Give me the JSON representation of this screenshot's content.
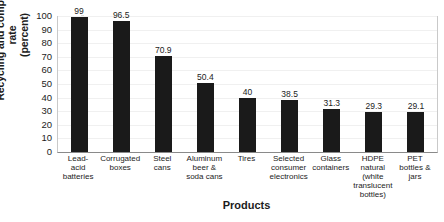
{
  "chart_data": {
    "type": "bar",
    "title": "",
    "xlabel": "Products",
    "ylabel": "Recycling and composting rate\n(percent)",
    "ylim": [
      0,
      100
    ],
    "yticks": [
      100,
      90,
      80,
      70,
      60,
      50,
      40,
      30,
      20,
      10,
      0
    ],
    "grid": true,
    "legend": "none",
    "bar_color": "#1a1a1a",
    "categories": [
      "Lead-\nacid\nbatteries",
      "Corrugated\nboxes",
      "Steel\ncans",
      "Aluminum\nbeer &\nsoda cans",
      "Tires",
      "Selected\nconsumer\nelectronics",
      "Glass\ncontainers",
      "HDPE\nnatural\n(white\ntranslucent\nbottles)",
      "PET\nbottles &\njars"
    ],
    "values": [
      99,
      96.5,
      70.9,
      50.4,
      40,
      38.5,
      31.3,
      29.3,
      29.1
    ],
    "value_labels": [
      "99",
      "96.5",
      "70.9",
      "50.4",
      "40",
      "38.5",
      "31.3",
      "29.3",
      "29.1"
    ]
  }
}
